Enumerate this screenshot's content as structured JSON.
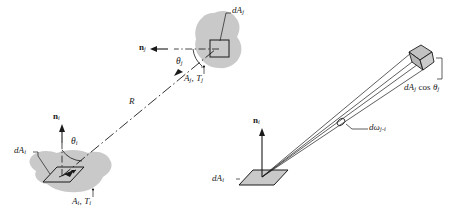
{
  "figure": {
    "background_color": "#ffffff",
    "ink_color": "#1a1a1a",
    "surface_fill": "#c9c9c9",
    "patch_fill": "#bdbdbd",
    "panels": [
      {
        "id": "left",
        "caption": ""
      },
      {
        "id": "right",
        "caption": ""
      }
    ]
  },
  "left_panel": {
    "labels": {
      "normal_j": {
        "symbol": "n",
        "sub": "j"
      },
      "theta_j": {
        "symbol": "θ",
        "sub": "j"
      },
      "area_temp_j": {
        "text": "A",
        "sub1": "j",
        "sep": ", ",
        "text2": "T",
        "sub2": "j"
      },
      "dA_j": {
        "prefix": "d",
        "symbol": "A",
        "sub": "j"
      },
      "distance_R": {
        "symbol": "R"
      },
      "normal_i": {
        "symbol": "n",
        "sub": "i"
      },
      "theta_i": {
        "symbol": "θ",
        "sub": "i"
      },
      "dA_i": {
        "prefix": "d",
        "symbol": "A",
        "sub": "i"
      },
      "area_temp_i": {
        "text": "A",
        "sub1": "i",
        "sep": ", ",
        "text2": "T",
        "sub2": "i"
      }
    }
  },
  "right_panel": {
    "labels": {
      "dA_j_cos_theta_j": {
        "prefix": "d",
        "symbol": "A",
        "sub": "j",
        "cos": " cos ",
        "theta": "θ",
        "theta_sub": "j"
      },
      "solid_angle": {
        "prefix": "d",
        "symbol": "ω",
        "sub": "j-i"
      },
      "normal_i": {
        "symbol": "n",
        "sub": "i"
      },
      "dA_i": {
        "prefix": "d",
        "symbol": "A",
        "sub": "i"
      }
    }
  }
}
